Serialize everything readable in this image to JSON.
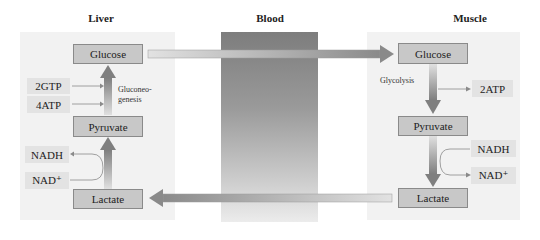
{
  "headers": {
    "liver": "Liver",
    "blood": "Blood",
    "muscle": "Muscle"
  },
  "liver": {
    "glucose": "Glucose",
    "pyruvate": "Pyruvate",
    "lactate": "Lactate",
    "inputs": [
      "2GTP",
      "4ATP"
    ],
    "process_label_line1": "Gluconeo-",
    "process_label_line2": "genesis",
    "cofactor_out": "NADH",
    "cofactor_in": "NAD⁺"
  },
  "muscle": {
    "glucose": "Glucose",
    "pyruvate": "Pyruvate",
    "lactate": "Lactate",
    "process_label": "Glycolysis",
    "output": "2ATP",
    "cofactor_in": "NADH",
    "cofactor_out": "NAD⁺"
  },
  "colors": {
    "panel": "#f2f2f2",
    "box": "#c8c8c8",
    "tag": "#e3e3e3",
    "blood_top": "#7d7d7d",
    "blood_bottom": "#ececec",
    "arrow": "#8c8c8c"
  }
}
